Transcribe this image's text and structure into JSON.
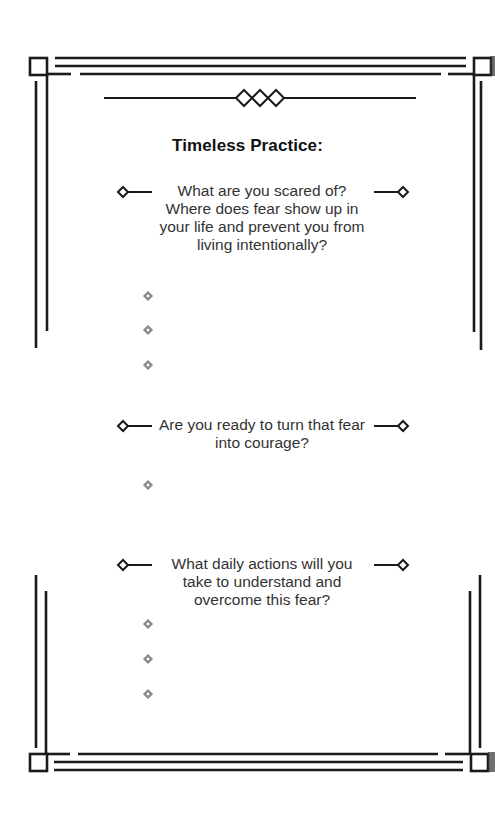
{
  "page": {
    "title": "Timeless Practice:",
    "questions": [
      {
        "text": "What are you scared of? Where does fear show up in your life and prevent you from living intentionally?",
        "answer_bullets": 3
      },
      {
        "text": "Are you ready to turn that fear into courage?",
        "answer_bullets": 1
      },
      {
        "text": "What daily actions will you take to understand and overcome this fear?",
        "answer_bullets": 3
      }
    ],
    "icons": {
      "header_ornament": "triple-diamond-divider-icon",
      "question_marker": "diamond-line-icon",
      "answer_bullet": "nested-diamond-bullet-icon"
    },
    "colors": {
      "ink": "#1a1a1a",
      "text": "#333333",
      "bullet": "#777777",
      "paper": "#ffffff"
    }
  }
}
